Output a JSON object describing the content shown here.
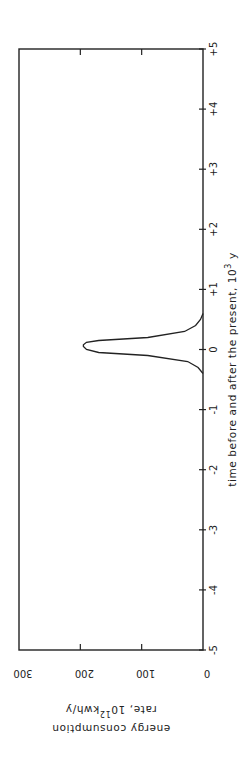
{
  "chart_data": {
    "type": "line",
    "orientation": "rotated-90-clockwise",
    "title": "",
    "xlabel": "time before and after the present, 10^3 y",
    "ylabel": "energy consumption rate, 10^12 kwh/y",
    "xlabel_parts": {
      "main": "time before and after the present, 10",
      "sup": "3",
      "tail": " y"
    },
    "ylabel_parts": {
      "line1": "energy consumption",
      "line2_pre": "rate, 10",
      "line2_sup": "12",
      "line2_post": "kwh/y"
    },
    "xlim": [
      -5,
      5
    ],
    "ylim": [
      0,
      300
    ],
    "x_ticks": [
      "-5",
      "-4",
      "-3",
      "-2",
      "-1",
      "0",
      "+1",
      "+2",
      "+3",
      "+4",
      "+5"
    ],
    "y_ticks": [
      "0",
      "100",
      "200",
      "300"
    ],
    "grid": false,
    "legend": null,
    "series": [
      {
        "name": "energy consumption",
        "x": [
          -5,
          -0.4,
          -0.3,
          -0.2,
          -0.1,
          -0.05,
          0.0,
          0.05,
          0.08,
          0.12,
          0.15,
          0.2,
          0.3,
          0.4,
          0.5,
          0.6,
          5
        ],
        "y": [
          0,
          0,
          8,
          25,
          90,
          170,
          190,
          195,
          195,
          190,
          170,
          90,
          30,
          12,
          4,
          0,
          0
        ]
      }
    ]
  }
}
